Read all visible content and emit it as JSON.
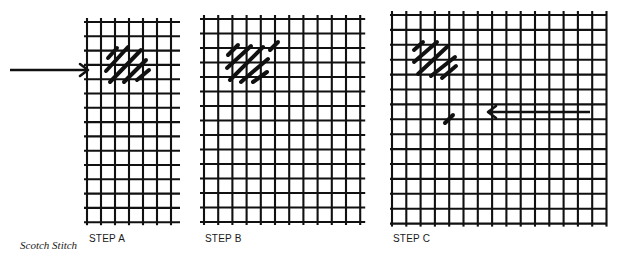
{
  "caption": "Scotch Stitch",
  "colors": {
    "ink": "#111111",
    "paper": "#ffffff"
  },
  "panels": [
    {
      "id": "A",
      "label": "STEP A",
      "label_pos": [
        89,
        233
      ],
      "grid": {
        "x0": 87,
        "y0": 22,
        "cols": 6,
        "rows": 14,
        "dx": 14.0,
        "dy": 14.3,
        "overhang_right": 9,
        "overhang_left": 3
      },
      "stitches": [
        [
          108,
          58,
          117,
          48
        ],
        [
          106,
          71,
          128,
          47
        ],
        [
          110,
          82,
          141,
          50
        ],
        [
          124,
          82,
          146,
          60
        ],
        [
          137,
          80,
          149,
          70
        ]
      ],
      "arrow": {
        "x1": 10,
        "y1": 70,
        "x2": 88,
        "y2": 70,
        "direction": "right"
      }
    },
    {
      "id": "B",
      "label": "STEP B",
      "label_pos": [
        205,
        233
      ],
      "grid": {
        "x0": 204,
        "y0": 19,
        "cols": 11,
        "rows": 14,
        "dx": 14.2,
        "dy": 14.5,
        "overhang_right": 5,
        "overhang_left": 4
      },
      "stitches": [
        [
          228,
          55,
          238,
          45
        ],
        [
          227,
          68,
          251,
          46
        ],
        [
          230,
          80,
          263,
          47
        ],
        [
          241,
          82,
          268,
          59
        ],
        [
          253,
          82,
          267,
          72
        ],
        [
          270,
          50,
          278,
          42
        ]
      ],
      "arrow": null
    },
    {
      "id": "C",
      "label": "STEP C",
      "label_pos": [
        393,
        233
      ],
      "grid": {
        "x0": 392,
        "y0": 15,
        "cols": 15,
        "rows": 14,
        "dx": 14.3,
        "dy": 14.9,
        "overhang_right": 0,
        "overhang_left": 2
      },
      "stitches": [
        [
          414,
          50,
          423,
          42
        ],
        [
          414,
          62,
          437,
          42
        ],
        [
          418,
          74,
          448,
          46
        ],
        [
          431,
          76,
          455,
          57
        ],
        [
          442,
          78,
          456,
          66
        ],
        [
          445,
          123,
          453,
          115
        ]
      ],
      "arrow": {
        "x1": 590,
        "y1": 112,
        "x2": 488,
        "y2": 112,
        "direction": "left"
      }
    }
  ]
}
